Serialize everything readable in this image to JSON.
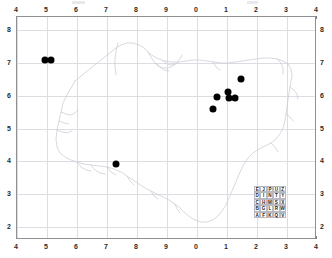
{
  "chart_data": {
    "type": "scatter",
    "title": "",
    "xlabel": "",
    "ylabel": "",
    "xlim": [
      4,
      14
    ],
    "ylim": [
      1.6,
      8.4
    ],
    "grid": true,
    "legend_position": "inside-bottom-right",
    "x_tick_positions": [
      4,
      5,
      6,
      7,
      8,
      9,
      10,
      11,
      12,
      13,
      14
    ],
    "x_tick_labels": [
      "4",
      "5",
      "6",
      "7",
      "8",
      "9",
      "0",
      "1",
      "2",
      "3",
      "4"
    ],
    "y_tick_positions": [
      8,
      7,
      6,
      5,
      4,
      3,
      2
    ],
    "y_tick_labels": [
      "8",
      "7",
      "6",
      "5",
      "4",
      "3",
      "2"
    ],
    "points": [
      {
        "x": 4.92,
        "y": 7.1
      },
      {
        "x": 5.12,
        "y": 7.1
      },
      {
        "x": 7.3,
        "y": 3.92
      },
      {
        "x": 11.45,
        "y": 6.52
      },
      {
        "x": 11.02,
        "y": 6.12
      },
      {
        "x": 10.68,
        "y": 5.95
      },
      {
        "x": 11.08,
        "y": 5.92
      },
      {
        "x": 11.28,
        "y": 5.92
      },
      {
        "x": 10.52,
        "y": 5.58
      }
    ],
    "point_color": "#000000",
    "point_count": 9,
    "coastline_color": "#c9c9d1",
    "grid_color": "#dcdce2",
    "frame_color": "#8f8f96"
  },
  "axes": {
    "top_labels": [
      "4",
      "5",
      "6",
      "7",
      "8",
      "9",
      "0",
      "1",
      "2",
      "3",
      "4"
    ],
    "bottom_labels": [
      "4",
      "5",
      "6",
      "7",
      "8",
      "9",
      "0",
      "1",
      "2",
      "3",
      "4"
    ],
    "left_labels": [
      "8",
      "7",
      "6",
      "5",
      "4",
      "3",
      "2"
    ],
    "right_labels": [
      "8",
      "7",
      "6",
      "5",
      "4",
      "3",
      "2"
    ]
  },
  "legend_grid": {
    "rows": [
      [
        "E",
        "J",
        "P",
        "U",
        "Z"
      ],
      [
        "D",
        "I",
        "N",
        "T",
        "Y"
      ],
      [
        "C",
        "H",
        "M",
        "S",
        "X"
      ],
      [
        "B",
        "G",
        "L",
        "R",
        "W"
      ],
      [
        "A",
        "F",
        "K",
        "Q",
        "V"
      ]
    ]
  }
}
